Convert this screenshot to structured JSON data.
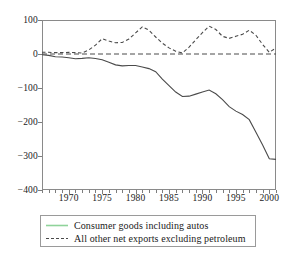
{
  "chart_data": {
    "type": "line",
    "title": "",
    "subtitle": "",
    "xlabel": "",
    "ylabel": "",
    "xlim": [
      1966,
      2001
    ],
    "ylim": [
      -400,
      100
    ],
    "grid": false,
    "legend_position": "bottom",
    "zero_reference_line": true,
    "y_ticks": [
      100,
      0,
      -100,
      -200,
      -300,
      -400
    ],
    "y_tick_labels": [
      "100",
      "0",
      "−100",
      "−200",
      "−300",
      "−400"
    ],
    "x_ticks": [
      1970,
      1975,
      1980,
      1985,
      1990,
      1995,
      2000
    ],
    "x_tick_labels": [
      "1970",
      "1975",
      "1980",
      "1985",
      "1990",
      "1995",
      "2000"
    ],
    "x_minor_tick_step": 1,
    "x": [
      1966,
      1967,
      1968,
      1969,
      1970,
      1971,
      1972,
      1973,
      1974,
      1975,
      1976,
      1977,
      1978,
      1979,
      1980,
      1981,
      1982,
      1983,
      1984,
      1985,
      1986,
      1987,
      1988,
      1989,
      1990,
      1991,
      1992,
      1993,
      1994,
      1995,
      1996,
      1997,
      1998,
      1999,
      2000,
      2001
    ],
    "series": [
      {
        "name": "Consumer goods including autos",
        "style": "solid",
        "color": "#4a4a4a",
        "legend_swatch_color": "#8fd39a",
        "values": [
          -2,
          -4,
          -8,
          -9,
          -11,
          -14,
          -13,
          -11,
          -13,
          -17,
          -24,
          -32,
          -35,
          -34,
          -34,
          -38,
          -43,
          -52,
          -74,
          -93,
          -112,
          -125,
          -124,
          -118,
          -112,
          -106,
          -117,
          -134,
          -155,
          -168,
          -178,
          -193,
          -230,
          -268,
          -308,
          -310
        ]
      },
      {
        "name": "All other net exports excluding petroleum",
        "style": "dashed",
        "color": "#4a4a4a",
        "legend_swatch_color": "#4a4a4a",
        "values": [
          5,
          5,
          4,
          4,
          5,
          4,
          3,
          12,
          26,
          45,
          38,
          33,
          34,
          44,
          62,
          80,
          70,
          50,
          32,
          18,
          8,
          3,
          20,
          42,
          63,
          82,
          72,
          52,
          46,
          52,
          58,
          70,
          55,
          28,
          5,
          18
        ]
      }
    ]
  },
  "legend": {
    "items": [
      {
        "label": "Consumer goods including autos",
        "style": "solid"
      },
      {
        "label": "All other net exports excluding petroleum",
        "style": "dashed"
      }
    ]
  }
}
